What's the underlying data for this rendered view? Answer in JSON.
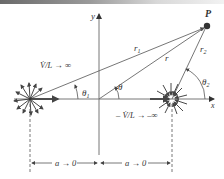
{
  "figure": {
    "point_label": "P",
    "axis_labels": {
      "x": "x",
      "y": "y"
    },
    "radius_labels": {
      "r1": "r",
      "r1_sub": "1",
      "r": "r",
      "r2": "r",
      "r2_sub": "2"
    },
    "angle_labels": {
      "theta1": "θ",
      "theta1_sub": "1",
      "theta": "θ",
      "theta2": "θ",
      "theta2_sub": "2"
    },
    "source_label": "V̇/L → ∞",
    "sink_label": "– V̇/L → –∞",
    "dimension_left": "a → 0",
    "dimension_right": "a → 0",
    "colors": {
      "line": "#555555",
      "dark": "#222222",
      "axis": "#666666"
    }
  }
}
